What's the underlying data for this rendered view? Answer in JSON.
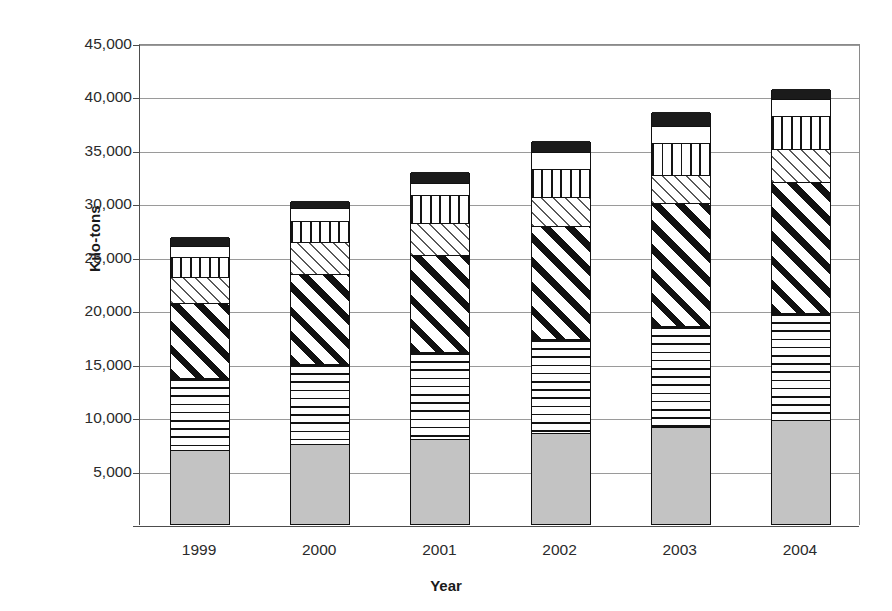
{
  "chart_data": {
    "type": "bar",
    "stacked": true,
    "title": "",
    "xlabel": "Year",
    "ylabel": "Kilo-tons",
    "categories": [
      "1999",
      "2000",
      "2001",
      "2002",
      "2003",
      "2004"
    ],
    "ytick_labels": [
      "5,000",
      "10,000",
      "15,000",
      "20,000",
      "25,000",
      "30,000",
      "35,000",
      "40,000",
      "45,000"
    ],
    "ytick_values": [
      5000,
      10000,
      15000,
      20000,
      25000,
      30000,
      35000,
      40000,
      45000
    ],
    "ylim": [
      0,
      45000
    ],
    "grid": true,
    "legend": "none",
    "series": [
      {
        "name": "Series 1",
        "pattern": "solid-gray",
        "color": "#c3c3c3",
        "values": [
          6850,
          7400,
          7880,
          8440,
          9000,
          9660
        ]
      },
      {
        "name": "Series 2",
        "pattern": "horizontal-lines",
        "color": "#ffffff",
        "values": [
          6750,
          7500,
          8160,
          8820,
          9470,
          10030
        ]
      },
      {
        "name": "Series 3",
        "pattern": "diagonal-thick",
        "color": "#ffffff",
        "values": [
          7030,
          8440,
          9000,
          10500,
          11440,
          12190
        ]
      },
      {
        "name": "Series 4",
        "pattern": "diagonal-thin",
        "color": "#ffffff",
        "values": [
          2350,
          2910,
          3000,
          2720,
          2630,
          3100
        ]
      },
      {
        "name": "Series 5",
        "pattern": "vertical-lines",
        "color": "#ffffff",
        "values": [
          1880,
          1970,
          2630,
          2630,
          3000,
          3100
        ]
      },
      {
        "name": "Series 6",
        "pattern": "white",
        "color": "#ffffff",
        "values": [
          1030,
          1220,
          1130,
          1600,
          1600,
          1600
        ]
      },
      {
        "name": "Series 7",
        "pattern": "black",
        "color": "#1b1b1b",
        "values": [
          940,
          750,
          1130,
          1130,
          1410,
          1030
        ]
      }
    ],
    "totals": [
      26830,
      30190,
      32930,
      35840,
      38550,
      40710
    ]
  }
}
